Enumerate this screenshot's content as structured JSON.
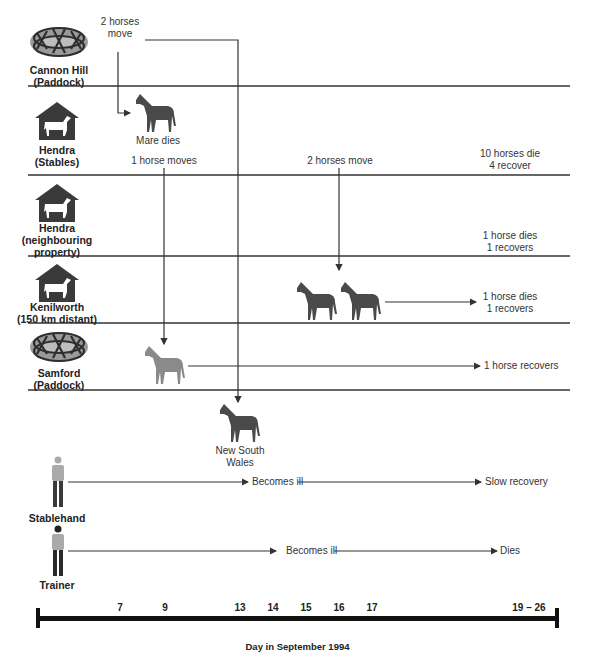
{
  "rows": [
    {
      "id": "cannon-hill",
      "label_line1": "Cannon Hill",
      "label_line2": "(Paddock)",
      "label_line3": "",
      "icon": "paddock-icon"
    },
    {
      "id": "hendra-stables",
      "label_line1": "Hendra",
      "label_line2": "(Stables)",
      "label_line3": "",
      "icon": "stable-icon"
    },
    {
      "id": "hendra-neighbouring",
      "label_line1": "Hendra",
      "label_line2": "(neighbouring",
      "label_line3": "property)",
      "icon": "stable-icon"
    },
    {
      "id": "kenilworth",
      "label_line1": "Kenilworth",
      "label_line2": "(150 km distant)",
      "label_line3": "",
      "icon": "stable-icon"
    },
    {
      "id": "samford",
      "label_line1": "Samford",
      "label_line2": "(Paddock)",
      "label_line3": "",
      "icon": "paddock-icon"
    }
  ],
  "events": {
    "cannon_move_line1": "2 horses",
    "cannon_move_line2": "move",
    "mare_dies": "Mare dies",
    "one_horse_moves": "1 horse moves",
    "two_horses_move": "2 horses move",
    "hendra_outcome_line1": "10 horses die",
    "hendra_outcome_line2": "4 recover",
    "neighbour_outcome_line1": "1 horse dies",
    "neighbour_outcome_line2": "1 recovers",
    "kenilworth_outcome_line1": "1 horse dies",
    "kenilworth_outcome_line2": "1 recovers",
    "samford_outcome": "1 horse recovers",
    "nsw_line1": "New South",
    "nsw_line2": "Wales"
  },
  "people": {
    "stablehand": {
      "label": "Stablehand",
      "event1": "Becomes ill",
      "event2": "Slow recovery"
    },
    "trainer": {
      "label": "Trainer",
      "event1": "Becomes ill",
      "event2": "Dies"
    }
  },
  "timeline": {
    "ticks": [
      "7",
      "9",
      "13",
      "14",
      "15",
      "16",
      "17",
      "19 – 26"
    ],
    "title": "Day in September 1994"
  },
  "colors": {
    "line": "#333333",
    "horse_dark": "#4a4a4a",
    "horse_light": "#8a8a8a",
    "icon": "#3a3a3a"
  }
}
